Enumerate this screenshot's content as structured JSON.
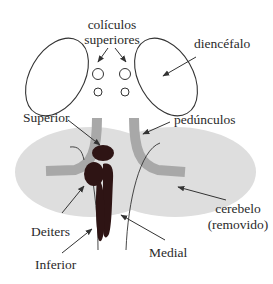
{
  "diagram": {
    "type": "anatomy-schematic",
    "labels": {
      "coliculos_line1": "colículos",
      "coliculos_line2": "superiores",
      "diencefalo": "diencéfalo",
      "superior": "Superior",
      "pedunculos": "pedúnculos",
      "deiters": "Deiters",
      "inferior": "Inferior",
      "medial": "Medial",
      "cerebelo_line1": "cerebelo",
      "cerebelo_line2": "(removido)"
    },
    "colors": {
      "outline": "#333333",
      "cerebellum_fill": "#dedede",
      "peduncle_fill": "#a8a8a8",
      "nuclei_fill": "#2e1414",
      "text": "#2a2a2a"
    }
  }
}
